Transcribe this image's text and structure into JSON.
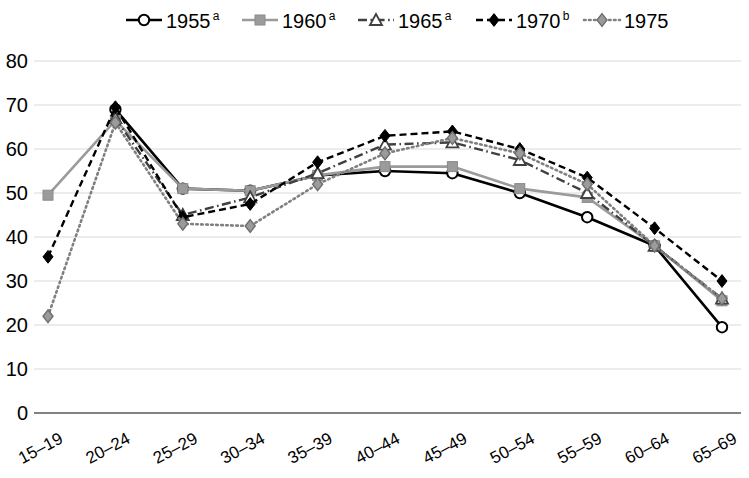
{
  "chart_data": {
    "type": "line",
    "title": "",
    "xlabel": "",
    "ylabel": "",
    "ylim": [
      0,
      80
    ],
    "ytick_step": 10,
    "yticks": [
      "0",
      "10",
      "20",
      "30",
      "40",
      "50",
      "60",
      "70",
      "80"
    ],
    "grid": true,
    "legend_position": "top",
    "categories": [
      "15–19",
      "20–24",
      "25–29",
      "30–34",
      "35–39",
      "40–44",
      "45–49",
      "50–54",
      "55–59",
      "60–64",
      "65–69"
    ],
    "series": [
      {
        "name": "1955",
        "superscript": "a",
        "color": "#000000",
        "marker": "circle-open",
        "dash": "solid",
        "values": [
          null,
          69.0,
          51.0,
          50.5,
          54.0,
          55.0,
          54.5,
          50.0,
          44.5,
          38.0,
          19.5
        ]
      },
      {
        "name": "1960",
        "superscript": "a",
        "color": "#9b9b9b",
        "marker": "square",
        "dash": "solid",
        "values": [
          49.5,
          66.5,
          51.0,
          50.5,
          54.0,
          56.0,
          56.0,
          51.0,
          49.0,
          38.0,
          25.5
        ]
      },
      {
        "name": "1965",
        "superscript": "a",
        "color": "#404040",
        "marker": "triangle-open",
        "dash": "dash-dot",
        "values": [
          null,
          67.0,
          45.0,
          49.0,
          54.5,
          61.0,
          61.5,
          57.5,
          50.0,
          38.0,
          26.0
        ]
      },
      {
        "name": "1970",
        "superscript": "b",
        "color": "#000000",
        "marker": "diamond-filled",
        "dash": "dashed",
        "values": [
          35.5,
          69.5,
          44.5,
          47.5,
          57.0,
          63.0,
          64.0,
          60.0,
          53.5,
          42.0,
          30.0
        ]
      },
      {
        "name": "1975",
        "superscript": "",
        "color": "#808080",
        "marker": "diamond-gray",
        "dash": "dotted",
        "values": [
          22.0,
          66.0,
          43.0,
          42.5,
          52.0,
          59.0,
          62.5,
          59.0,
          52.0,
          38.0,
          26.0
        ]
      }
    ]
  },
  "legend": {
    "items": [
      {
        "label": "1955",
        "sup": "a"
      },
      {
        "label": "1960",
        "sup": "a"
      },
      {
        "label": "1965",
        "sup": "a"
      },
      {
        "label": "1970",
        "sup": "b"
      },
      {
        "label": "1975",
        "sup": ""
      }
    ]
  }
}
